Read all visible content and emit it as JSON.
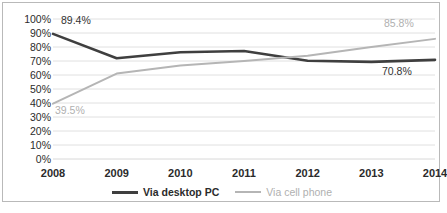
{
  "chart_data": {
    "type": "line",
    "title": "",
    "xlabel": "",
    "ylabel": "",
    "categories": [
      "2008",
      "2009",
      "2010",
      "2011",
      "2012",
      "2013",
      "2014"
    ],
    "ylim": [
      0,
      100
    ],
    "yticks": [
      "0%",
      "10%",
      "20%",
      "30%",
      "40%",
      "50%",
      "60%",
      "70%",
      "80%",
      "90%",
      "100%"
    ],
    "ytick_values": [
      0,
      10,
      20,
      30,
      40,
      50,
      60,
      70,
      80,
      90,
      100
    ],
    "grid": true,
    "legend_position": "bottom",
    "series": [
      {
        "name": "Via desktop PC",
        "color": "#3f3f3f",
        "values": [
          89.4,
          72.0,
          76.3,
          77.1,
          70.2,
          69.4,
          70.8
        ]
      },
      {
        "name": "Via cell phone",
        "color": "#b5b5b5",
        "values": [
          39.5,
          61.0,
          66.8,
          70.0,
          73.8,
          80.0,
          85.8
        ]
      }
    ],
    "annotations": [
      {
        "text": "89.4%",
        "series": "Via desktop PC",
        "category": "2008",
        "value": 89.4,
        "color": "#333333"
      },
      {
        "text": "39.5%",
        "series": "Via cell phone",
        "category": "2008",
        "value": 39.5,
        "color": "#b0b0b0"
      },
      {
        "text": "85.8%",
        "series": "Via cell phone",
        "category": "2014",
        "value": 85.8,
        "color": "#b0b0b0"
      },
      {
        "text": "70.8%",
        "series": "Via desktop PC",
        "category": "2014",
        "value": 70.8,
        "color": "#333333"
      }
    ]
  },
  "axis": {
    "y_labels": [
      "100%",
      "90%",
      "80%",
      "70%",
      "60%",
      "50%",
      "40%",
      "30%",
      "20%",
      "10%",
      "0%"
    ],
    "x_labels": [
      "2008",
      "2009",
      "2010",
      "2011",
      "2012",
      "2013",
      "2014"
    ]
  },
  "legend": {
    "items": [
      {
        "label": "Via desktop PC"
      },
      {
        "label": "Via cell phone"
      }
    ]
  },
  "labels": {
    "desktop_first": "89.4%",
    "cell_first": "39.5%",
    "cell_last": "85.8%",
    "desktop_last": "70.8%"
  },
  "colors": {
    "desktop_line": "#3f3f3f",
    "cell_line": "#b5b5b5",
    "gridline": "#d8d8d8",
    "border": "#b9b9b9",
    "text": "#2b2b2b"
  }
}
